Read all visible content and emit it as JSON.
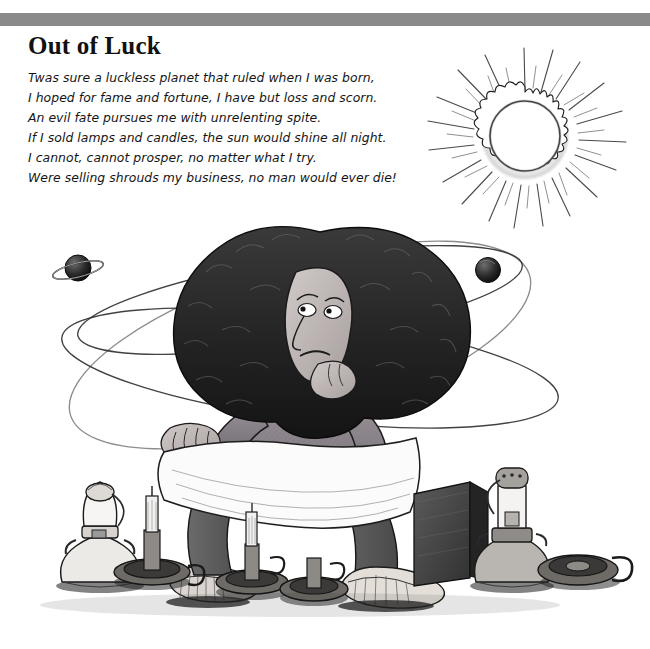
{
  "page": {
    "background_color": "#ffffff",
    "rule_color": "#8a8a8a"
  },
  "poem": {
    "title": "Out of Luck",
    "lines": [
      "Twas sure a luckless planet that ruled when I was born,",
      "I hoped for fame and fortune, I have but loss and scorn.",
      "An evil fate pursues me with unrelenting spite.",
      "If I sold lamps and candles, the sun would shine all night.",
      "I cannot, cannot prosper, no matter what I try.",
      "Were selling shrouds my business, no man would ever die!"
    ]
  },
  "illustration": {
    "description": "Pen-and-ink cartoon of a glum woman with a huge afro resting her chin on her hand, seated with a white shroud over her lap, surrounded by unlit oil lamps and candles, with planets orbiting her head and a blazing sun above.",
    "elements": [
      {
        "name": "sun",
        "label": "blazing sun with corona and rays",
        "cx": 525,
        "cy": 136,
        "r": 40
      },
      {
        "name": "planet-ringed",
        "label": "ringed planet",
        "cx": 78,
        "cy": 268,
        "r": 13
      },
      {
        "name": "planet-dark",
        "label": "dark sphere planet",
        "cx": 488,
        "cy": 270,
        "r": 12
      },
      {
        "name": "orbit-ring-upper",
        "label": "orbit ellipse upper"
      },
      {
        "name": "orbit-ring-lower",
        "label": "orbit ellipse lower"
      },
      {
        "name": "figure",
        "label": "seated woman with afro hair"
      },
      {
        "name": "shroud",
        "label": "white cloth shroud over lap"
      },
      {
        "name": "oil-lamp-left",
        "label": "unlit oil lamp, left"
      },
      {
        "name": "candle-holder-left",
        "label": "candle holder with candle, left"
      },
      {
        "name": "candle-holder-center-left",
        "label": "candle holder with candle, center left"
      },
      {
        "name": "candle-holder-center",
        "label": "candle holder with candle, center"
      },
      {
        "name": "oil-lamp-right",
        "label": "unlit oil lamp, right"
      },
      {
        "name": "candle-holder-right",
        "label": "empty candle holder, right"
      },
      {
        "name": "crate",
        "label": "dark wooden crate"
      },
      {
        "name": "shoe-left",
        "label": "worn shoe, left"
      },
      {
        "name": "shoe-right",
        "label": "worn shoe, right"
      }
    ]
  }
}
